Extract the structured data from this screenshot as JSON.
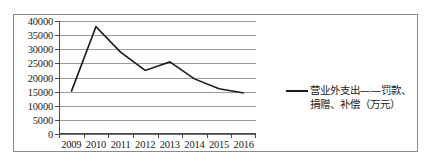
{
  "chart_data": {
    "type": "line",
    "title": "",
    "xlabel": "",
    "ylabel": "",
    "categories": [
      "2009",
      "2010",
      "2011",
      "2012",
      "2013",
      "2014",
      "2015",
      "2016"
    ],
    "series": [
      {
        "name": "营业外支出——罚款、捐赠、补偿（万元）",
        "values": [
          15000,
          38000,
          29000,
          22500,
          25500,
          19500,
          16000,
          14500
        ],
        "color": "#1a1a1a"
      }
    ],
    "ylim": [
      0,
      40000
    ],
    "ytick_step": 5000,
    "yticks": [
      0,
      5000,
      10000,
      15000,
      20000,
      25000,
      30000,
      35000,
      40000
    ],
    "ytick_labels": [
      "0",
      "5000",
      "10000",
      "15000",
      "20000",
      "25000",
      "30000",
      "35000",
      "40000"
    ],
    "grid": true,
    "legend_position": "right",
    "legend_entries": [
      "营业外支出——罚款、捐赠、补偿（万元）"
    ]
  },
  "figure": {
    "border_color": "#8a8a8a",
    "gridline_color": "#9c9c9c",
    "axis_color": "#4a4a4a",
    "background": "#ffffff"
  }
}
